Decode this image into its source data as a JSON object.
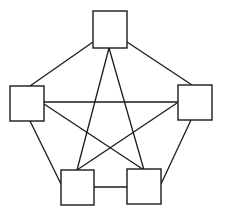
{
  "diagram": {
    "type": "complete-graph-K5",
    "colors": {
      "stroke": "#1a1a1a",
      "fill": "#ffffff",
      "background": "#ffffff"
    },
    "nodes": [
      {
        "id": "top",
        "x": 93,
        "y": 11,
        "w": 34,
        "h": 37
      },
      {
        "id": "left",
        "x": 10,
        "y": 86,
        "w": 34,
        "h": 35
      },
      {
        "id": "right",
        "x": 178,
        "y": 85,
        "w": 34,
        "h": 35
      },
      {
        "id": "bottom-left",
        "x": 61,
        "y": 170,
        "w": 33,
        "h": 35
      },
      {
        "id": "bottom-right",
        "x": 127,
        "y": 169,
        "w": 34,
        "h": 35
      }
    ],
    "edges": [
      {
        "from": "top",
        "to": "left",
        "x1": 93,
        "y1": 42,
        "x2": 30,
        "y2": 86
      },
      {
        "from": "top",
        "to": "right",
        "x1": 127,
        "y1": 42,
        "x2": 192,
        "y2": 85
      },
      {
        "from": "left",
        "to": "bottom-left",
        "x1": 30,
        "y1": 121,
        "x2": 61,
        "y2": 184
      },
      {
        "from": "right",
        "to": "bottom-right",
        "x1": 191,
        "y1": 120,
        "x2": 161,
        "y2": 184
      },
      {
        "from": "bottom-left",
        "to": "bottom-right",
        "x1": 94,
        "y1": 187,
        "x2": 127,
        "y2": 187
      },
      {
        "from": "top",
        "to": "bottom-left",
        "x1": 109,
        "y1": 48,
        "x2": 77,
        "y2": 170
      },
      {
        "from": "top",
        "to": "bottom-right",
        "x1": 109,
        "y1": 48,
        "x2": 144,
        "y2": 170
      },
      {
        "from": "left",
        "to": "right",
        "x1": 44,
        "y1": 102,
        "x2": 178,
        "y2": 102
      },
      {
        "from": "left",
        "to": "bottom-right",
        "x1": 44,
        "y1": 104,
        "x2": 144,
        "y2": 170
      },
      {
        "from": "right",
        "to": "bottom-left",
        "x1": 177,
        "y1": 103,
        "x2": 77,
        "y2": 170
      }
    ]
  }
}
